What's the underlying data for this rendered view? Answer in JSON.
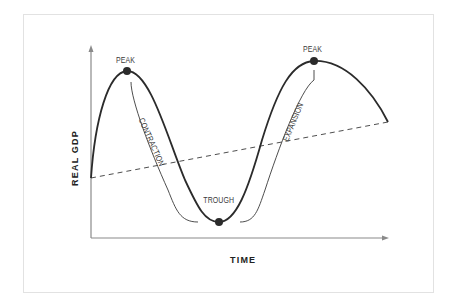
{
  "diagram": {
    "type": "business-cycle",
    "axes": {
      "y_label": "REAL GDP",
      "x_label": "TIME"
    },
    "points": [
      {
        "label": "PEAK",
        "role": "first-peak"
      },
      {
        "label": "TROUGH",
        "role": "trough"
      },
      {
        "label": "PEAK",
        "role": "second-peak"
      }
    ],
    "phases": [
      {
        "label": "CONTRACTION"
      },
      {
        "label": "EXPANSION"
      }
    ],
    "trend_line": {
      "style": "dashed"
    },
    "colors": {
      "curve": "#2b2b2b",
      "axis": "#8a8a8a",
      "frame": "#e2e2e2",
      "text": "#3a3a3a"
    }
  }
}
